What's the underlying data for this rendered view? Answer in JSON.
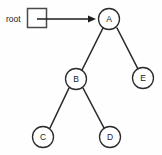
{
  "diagram": {
    "type": "binary-tree",
    "title": "",
    "canvas": {
      "width": 162,
      "height": 155,
      "background": "#fefefe"
    },
    "root_pointer": {
      "label": "root",
      "label_x": 6,
      "label_y": 19,
      "box": {
        "x": 27,
        "y": 8,
        "width": 20,
        "height": 20
      },
      "arrow": {
        "x1": 37,
        "y1": 19,
        "x2": 95,
        "y2": 19
      }
    },
    "nodes": [
      {
        "id": "A",
        "label": "A",
        "cx": 109,
        "cy": 19,
        "r": 10.5
      },
      {
        "id": "B",
        "label": "B",
        "cx": 76,
        "cy": 79,
        "r": 10.5
      },
      {
        "id": "E",
        "label": "E",
        "cx": 143,
        "cy": 78,
        "r": 10.5
      },
      {
        "id": "C",
        "label": "C",
        "cx": 43,
        "cy": 137,
        "r": 10.5
      },
      {
        "id": "D",
        "label": "D",
        "cx": 110,
        "cy": 137,
        "r": 10.5
      }
    ],
    "edges": [
      {
        "from": "A",
        "to": "B",
        "x1": 103,
        "y1": 28,
        "x2": 82,
        "y2": 70
      },
      {
        "from": "A",
        "to": "E",
        "x1": 117,
        "y1": 28,
        "x2": 138,
        "y2": 69
      },
      {
        "from": "B",
        "to": "C",
        "x1": 69,
        "y1": 88,
        "x2": 50,
        "y2": 128
      },
      {
        "from": "B",
        "to": "D",
        "x1": 83,
        "y1": 88,
        "x2": 104,
        "y2": 128
      }
    ],
    "colors": {
      "stroke": "#2b2b2b",
      "node_fill": "#ffffff",
      "text": "#1a1a1a",
      "box_stroke": "#4a4a4a"
    }
  }
}
